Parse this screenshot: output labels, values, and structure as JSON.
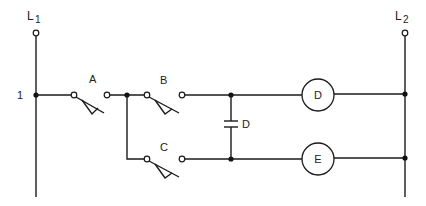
{
  "diagram": {
    "type": "ladder-logic",
    "lines": {
      "left": {
        "label_main": "L",
        "label_sub": "1"
      },
      "right": {
        "label_main": "L",
        "label_sub": "2"
      }
    },
    "rung_number": "1",
    "switches": [
      {
        "id": "A",
        "label": "A",
        "type": "normally-open"
      },
      {
        "id": "B",
        "label": "B",
        "type": "normally-open"
      },
      {
        "id": "C",
        "label": "C",
        "type": "normally-open"
      }
    ],
    "contact": {
      "label": "D",
      "type": "normally-open-contact"
    },
    "coils": [
      {
        "id": "D",
        "label": "D"
      },
      {
        "id": "E",
        "label": "E"
      }
    ]
  }
}
